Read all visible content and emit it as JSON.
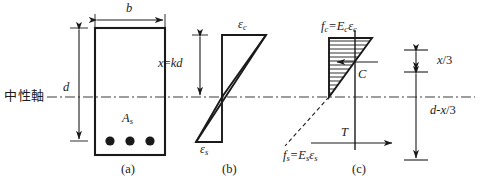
{
  "figure": {
    "neutral_axis_label": "中性軸",
    "line_color": "#1a1a1a",
    "background": "#ffffff"
  },
  "panels": [
    {
      "id": "a",
      "caption": "(a)",
      "description": "beam cross-section",
      "labels": {
        "width": "b",
        "depth": "d",
        "steel_area": "A",
        "steel_area_sub": "s"
      },
      "rebar_count": 3
    },
    {
      "id": "b",
      "caption": "(b)",
      "description": "strain distribution",
      "labels": {
        "neutral_depth": "x",
        "neutral_depth_eq": "=",
        "neutral_depth_val": "kd",
        "concrete_strain": "ε",
        "concrete_strain_sub": "c",
        "steel_strain": "ε",
        "steel_strain_sub": "s"
      }
    },
    {
      "id": "c",
      "caption": "(c)",
      "description": "stress distribution and internal forces",
      "labels": {
        "concrete_stress": "f",
        "concrete_stress_sub": "c",
        "concrete_stress_eq": "=E",
        "concrete_stress_eq_sub": "c",
        "concrete_stress_eq_tail": "ε",
        "concrete_stress_eq_tail_sub": "c",
        "steel_stress": "f",
        "steel_stress_sub": "s",
        "steel_stress_eq": "=E",
        "steel_stress_eq_sub": "s",
        "steel_stress_eq_tail": "ε",
        "steel_stress_eq_tail_sub": "s",
        "compression_force": "C",
        "tension_force": "T",
        "lever_top": "x",
        "lever_top_frac": "/3",
        "lever_bottom": "d",
        "lever_bottom_minus": "-x",
        "lever_bottom_frac": "/3"
      }
    }
  ]
}
